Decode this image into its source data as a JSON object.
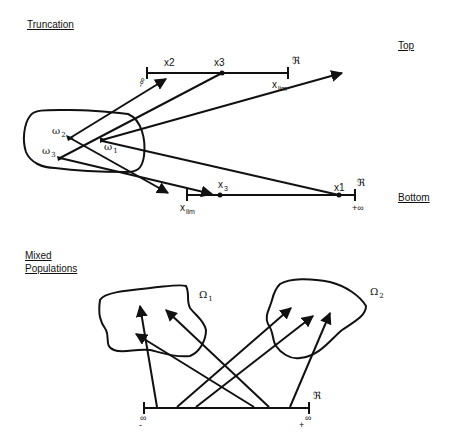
{
  "sections": {
    "truncation": {
      "heading": "Truncation",
      "top_label": "Top",
      "bottom_label": "Bottom",
      "top_axis": {
        "real_symbol": "ℜ",
        "neg_inf": "-∞",
        "points": [
          "x2",
          "x3"
        ],
        "limit": "x",
        "limit_sub": "lim"
      },
      "bottom_axis": {
        "real_symbol": "ℜ",
        "pos_inf_sign": "+",
        "pos_inf": "∞",
        "points": [
          "x",
          "x1"
        ],
        "x3_main": "x",
        "x3_sub": "3",
        "limit": "x",
        "limit_sub": "lim"
      },
      "population_points": [
        {
          "symbol": "ω",
          "sub": "1"
        },
        {
          "symbol": "ω",
          "sub": "2"
        },
        {
          "symbol": "ω",
          "sub": "3"
        }
      ]
    },
    "mixed": {
      "heading_line1": "Mixed",
      "heading_line2": "Populations",
      "populations": [
        {
          "symbol": "Ω",
          "sub": "1"
        },
        {
          "symbol": "Ω",
          "sub": "2"
        }
      ],
      "axis": {
        "real_symbol": "ℜ",
        "neg_sign": "-",
        "neg_inf": "∞",
        "pos_sign": "+",
        "pos_inf": "∞"
      }
    }
  },
  "colors": {
    "ink": "#111111",
    "background": "#ffffff"
  }
}
